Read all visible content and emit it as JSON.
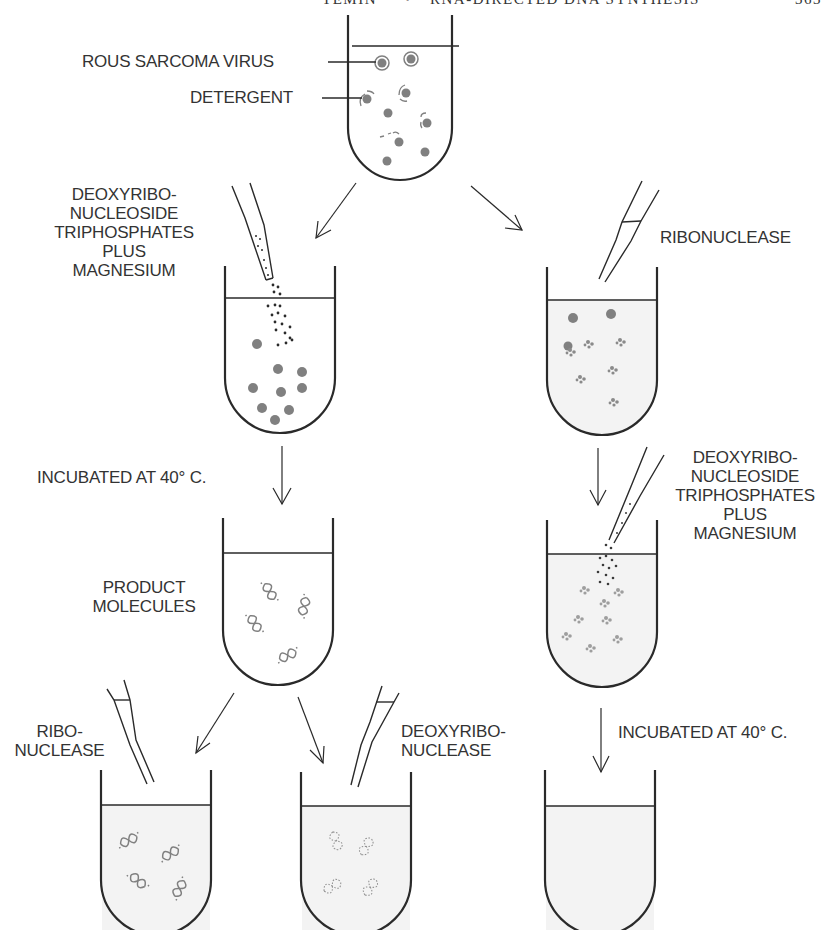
{
  "header": {
    "author": "TEMIN",
    "separator": "•",
    "title": "RNA-DIRECTED DNA SYNTHESIS",
    "page_number": "363"
  },
  "colors": {
    "line": "#2a2a2a",
    "particle": "#808080",
    "liquid": "#f1f1f1"
  },
  "labels": {
    "virus": "ROUS SARCOMA VIRUS",
    "detergent": "DETERGENT",
    "dntp_left": [
      "DEOXYRIBO-",
      "NUCLEOSIDE",
      "TRIPHOSPHATES",
      "PLUS",
      "MAGNESIUM"
    ],
    "ribonuclease_top": "RIBONUCLEASE",
    "incubated_left": "INCUBATED AT 40° C.",
    "product": [
      "PRODUCT",
      "MOLECULES"
    ],
    "dntp_right": [
      "DEOXYRIBO-",
      "NUCLEOSIDE",
      "TRIPHOSPHATES",
      "PLUS",
      "MAGNESIUM"
    ],
    "ribonuclease_bottom": [
      "RIBO-",
      "NUCLEASE"
    ],
    "deoxyribonuclease": [
      "DEOXYRIBO-",
      "NUCLEASE"
    ],
    "incubated_right": "INCUBATED AT 40° C."
  },
  "tubes": [
    {
      "id": "virus-detergent",
      "contents": "virus particles, disrupted"
    },
    {
      "id": "dntp-added",
      "contents": "virus cores plus nucleotides"
    },
    {
      "id": "ribonuclease-treated",
      "contents": "degraded RNA"
    },
    {
      "id": "product",
      "contents": "DNA product molecules"
    },
    {
      "id": "ribonuclease-then-dntp",
      "contents": "degraded RNA plus nucleotides"
    },
    {
      "id": "product-ribonuclease",
      "contents": "intact DNA"
    },
    {
      "id": "product-deoxyribonuclease",
      "contents": "degraded DNA"
    },
    {
      "id": "no-product",
      "contents": "empty"
    }
  ]
}
